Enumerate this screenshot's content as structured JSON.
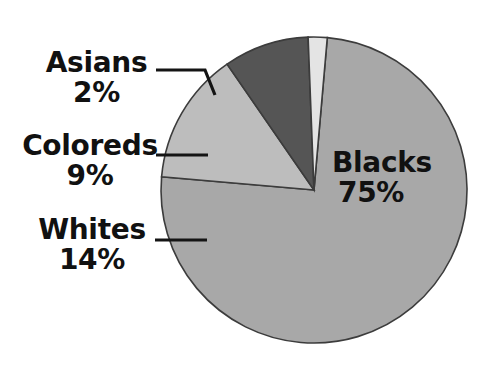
{
  "chart_data": {
    "type": "pie",
    "title": "",
    "categories": [
      "Blacks",
      "Whites",
      "Coloreds",
      "Asians"
    ],
    "values": [
      75,
      14,
      9,
      2
    ],
    "unit": "%",
    "labels": [
      {
        "name": "Blacks",
        "percent": "75%",
        "value": 75,
        "color": "#a8a8a8",
        "placement": "inside"
      },
      {
        "name": "Whites",
        "percent": "14%",
        "value": 14,
        "color": "#bdbdbd",
        "placement": "outside-left"
      },
      {
        "name": "Coloreds",
        "percent": "9%",
        "value": 9,
        "color": "#555555",
        "placement": "outside-left"
      },
      {
        "name": "Asians",
        "percent": "2%",
        "value": 2,
        "color": "#e4e4e4",
        "placement": "outside-left"
      }
    ],
    "legend": "none",
    "grid": false,
    "total": 100
  },
  "pie": {
    "blacks": {
      "name": "Blacks",
      "percent": "75%"
    },
    "whites": {
      "name": "Whites",
      "percent": "14%"
    },
    "coloreds": {
      "name": "Coloreds",
      "percent": "9%"
    },
    "asians": {
      "name": "Asians",
      "percent": "2%"
    }
  },
  "colors": {
    "blacks": "#a8a8a8",
    "whites": "#bdbdbd",
    "coloreds": "#555555",
    "asians": "#e4e4e4",
    "outline": "#3c3c3c",
    "text": "#111111",
    "background": "#ffffff"
  }
}
